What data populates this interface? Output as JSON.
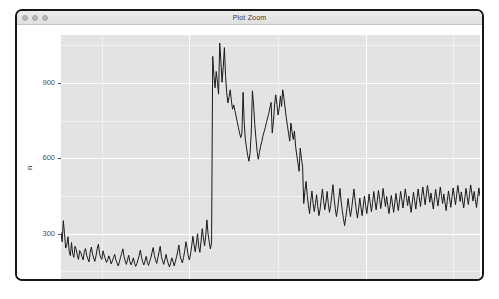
{
  "window": {
    "title": "Plot Zoom",
    "traffic_lights": [
      {
        "name": "close-button",
        "color": "#b6b6b6"
      },
      {
        "name": "minimize-button",
        "color": "#b6b6b6"
      },
      {
        "name": "maximize-button",
        "color": "#b6b6b6"
      }
    ]
  },
  "colors": {
    "panel_background": "#e3e3e3",
    "grid_major": "#ffffff",
    "grid_minor": "#f1f1f1",
    "line": "#1a1a1a",
    "axis_text": "#4d4d4d",
    "title_text": "#1c1c1c",
    "window_border": "#161616",
    "titlebar": "#e6e6e6"
  },
  "chart_data": {
    "type": "line",
    "title": "",
    "xlabel": "date",
    "ylabel": "n",
    "grid": true,
    "legend": "none",
    "ylim": [
      120,
      1090
    ],
    "y_ticks": [
      300,
      600,
      900
    ],
    "y_minor_ticks": [
      150,
      450,
      750,
      1050
    ],
    "x_ticks": [
      "Apr",
      "Jul"
    ],
    "x_tick_positions": [
      0.305,
      0.728
    ],
    "x_minor_tick_positions": [
      0.097,
      0.517,
      0.935
    ],
    "x_axis_type": "date",
    "series": [
      {
        "name": "n",
        "values": [
          305,
          268,
          352,
          300,
          243,
          256,
          288,
          230,
          213,
          265,
          221,
          206,
          250,
          238,
          214,
          198,
          233,
          225,
          208,
          196,
          229,
          241,
          214,
          200,
          188,
          226,
          247,
          219,
          203,
          190,
          212,
          240,
          258,
          222,
          205,
          198,
          232,
          215,
          200,
          186,
          196,
          212,
          198,
          180,
          192,
          205,
          218,
          196,
          184,
          172,
          188,
          206,
          222,
          240,
          210,
          192,
          178,
          196,
          214,
          190,
          176,
          188,
          204,
          183,
          170,
          182,
          196,
          214,
          235,
          206,
          188,
          176,
          192,
          210,
          186,
          174,
          190,
          205,
          226,
          245,
          214,
          196,
          182,
          204,
          228,
          250,
          210,
          192,
          178,
          196,
          218,
          196,
          180,
          168,
          186,
          204,
          188,
          172,
          190,
          208,
          230,
          255,
          214,
          196,
          184,
          206,
          232,
          268,
          244,
          212,
          196,
          220,
          252,
          290,
          256,
          228,
          262,
          300,
          248,
          226,
          270,
          320,
          285,
          252,
          292,
          355,
          300,
          268,
          240,
          262,
          1005,
          930,
          880,
          945,
          902,
          855,
          1058,
          985,
          902,
          962,
          1040,
          925,
          860,
          820,
          845,
          872,
          828,
          795,
          812,
          790,
          768,
          745,
          722,
          700,
          682,
          700,
          862,
          740,
          672,
          640,
          610,
          588,
          622,
          700,
          868,
          812,
          735,
          680,
          628,
          596,
          622,
          648,
          665,
          688,
          705,
          722,
          742,
          760,
          778,
          800,
          822,
          700,
          745,
          812,
          852,
          815,
          772,
          800,
          848,
          806,
          872,
          840,
          800,
          762,
          730,
          698,
          668,
          740,
          705,
          675,
          708,
          648,
          612,
          582,
          548,
          640,
          600,
          565,
          420,
          470,
          508,
          452,
          412,
          380,
          432,
          470,
          420,
          388,
          420,
          455,
          408,
          372,
          398,
          438,
          478,
          432,
          395,
          425,
          468,
          420,
          385,
          412,
          452,
          495,
          440,
          400,
          368,
          398,
          440,
          480,
          430,
          392,
          360,
          332,
          365,
          400,
          440,
          402,
          368,
          398,
          438,
          478,
          432,
          395,
          362,
          398,
          442,
          405,
          372,
          410,
          450,
          412,
          380,
          418,
          458,
          420,
          388,
          425,
          468,
          430,
          395,
          432,
          472,
          436,
          400,
          438,
          480,
          442,
          408,
          448,
          412,
          380,
          415,
          452,
          418,
          385,
          422,
          460,
          425,
          392,
          430,
          468,
          435,
          402,
          440,
          478,
          445,
          412,
          450,
          418,
          385,
          425,
          465,
          432,
          398,
          438,
          478,
          442,
          408,
          448,
          486,
          450,
          415,
          455,
          492,
          458,
          425,
          462,
          430,
          398,
          438,
          476,
          442,
          410,
          448,
          486,
          452,
          420,
          458,
          425,
          392,
          432,
          470,
          438,
          405,
          445,
          482,
          448,
          415,
          455,
          492,
          460,
          428,
          466,
          434,
          402,
          442,
          480,
          448,
          416,
          456,
          494,
          462,
          430,
          468,
          436,
          404,
          444,
          482,
          450
        ]
      }
    ]
  }
}
